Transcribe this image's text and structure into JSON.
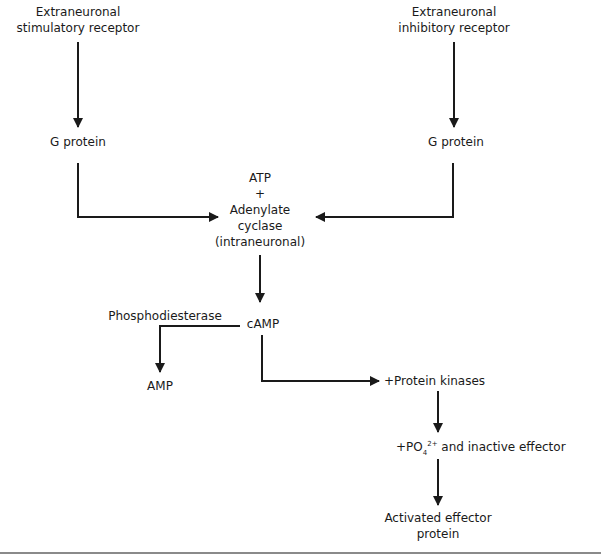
{
  "diagram": {
    "type": "flowchart",
    "nodes": {
      "stim_receptor": {
        "line1": "Extraneuronal",
        "line2": "stimulatory receptor"
      },
      "inhib_receptor": {
        "line1": "Extraneuronal",
        "line2": "inhibitory receptor"
      },
      "g_protein_left": "G protein",
      "g_protein_right": "G protein",
      "adenylate": {
        "line1": "ATP",
        "line2": "+",
        "line3": "Adenylate",
        "line4": "cyclase",
        "line5": "(intraneuronal)"
      },
      "phosphodiesterase": "Phosphodiesterase",
      "camp": "cAMP",
      "amp": "AMP",
      "protein_kinases": "+Protein kinases",
      "po4": {
        "prefix": "+PO",
        "subscript": "4",
        "superscript": "2+",
        "suffix": " and inactive effector"
      },
      "activated": {
        "line1": "Activated effector",
        "line2": "protein"
      }
    },
    "edges": [
      {
        "from": "stim_receptor",
        "to": "g_protein_left"
      },
      {
        "from": "inhib_receptor",
        "to": "g_protein_right"
      },
      {
        "from": "g_protein_left",
        "to": "adenylate"
      },
      {
        "from": "g_protein_right",
        "to": "adenylate"
      },
      {
        "from": "adenylate",
        "to": "camp"
      },
      {
        "from": "camp",
        "to": "amp",
        "via": "phosphodiesterase"
      },
      {
        "from": "camp",
        "to": "protein_kinases"
      },
      {
        "from": "protein_kinases",
        "to": "po4"
      },
      {
        "from": "po4",
        "to": "activated"
      }
    ],
    "colors": {
      "line": "#1a1a1a",
      "rule": "#8a8a8a"
    }
  }
}
